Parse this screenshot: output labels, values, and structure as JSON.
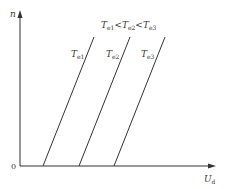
{
  "diagram": {
    "type": "characteristic-curves",
    "axes": {
      "y_label": "n",
      "x_label_main": "U",
      "x_label_sub": "d",
      "origin_label": "0"
    },
    "relation_label": {
      "parts": [
        {
          "main": "T",
          "sub": "e1"
        },
        {
          "op": "<"
        },
        {
          "main": "T",
          "sub": "e2"
        },
        {
          "op": "<"
        },
        {
          "main": "T",
          "sub": "e3"
        }
      ]
    },
    "curves": [
      {
        "main": "T",
        "sub": "e1",
        "x_bottom": 43,
        "x_top": 94
      },
      {
        "main": "T",
        "sub": "e2",
        "x_bottom": 79,
        "x_top": 130
      },
      {
        "main": "T",
        "sub": "e3",
        "x_bottom": 114,
        "x_top": 165
      }
    ],
    "colors": {
      "line": "#333333",
      "background": "#ffffff"
    }
  }
}
